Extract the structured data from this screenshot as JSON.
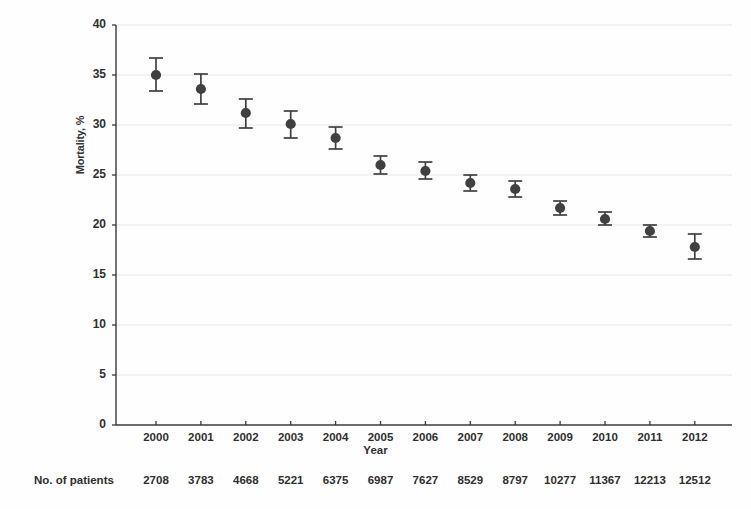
{
  "chart_data": {
    "type": "scatter",
    "title": "",
    "xlabel": "Year",
    "ylabel": "Mortality, %",
    "x": [
      2000,
      2001,
      2002,
      2003,
      2004,
      2005,
      2006,
      2007,
      2008,
      2009,
      2010,
      2011,
      2012
    ],
    "categories": [
      "2000",
      "2001",
      "2002",
      "2003",
      "2004",
      "2005",
      "2006",
      "2007",
      "2008",
      "2009",
      "2010",
      "2011",
      "2012"
    ],
    "values": [
      35.0,
      33.6,
      31.2,
      30.1,
      28.7,
      26.0,
      25.4,
      24.2,
      23.6,
      21.7,
      20.6,
      19.4,
      17.8
    ],
    "error_low": [
      33.4,
      32.1,
      29.7,
      28.7,
      27.6,
      25.1,
      24.6,
      23.4,
      22.8,
      21.0,
      20.0,
      18.8,
      16.6
    ],
    "error_high": [
      36.7,
      35.1,
      32.6,
      31.4,
      29.8,
      26.9,
      26.3,
      25.0,
      24.4,
      22.4,
      21.3,
      20.0,
      19.1
    ],
    "error_type": "95% CI",
    "xlim": [
      1999.5,
      2012.5
    ],
    "ylim": [
      0,
      40
    ],
    "yticks": [
      0,
      5,
      10,
      15,
      20,
      25,
      30,
      35,
      40
    ],
    "ytick_labels": [
      "0",
      "5",
      "10",
      "15",
      "20",
      "25",
      "30",
      "35",
      "40"
    ],
    "xticks": [
      2000,
      2001,
      2002,
      2003,
      2004,
      2005,
      2006,
      2007,
      2008,
      2009,
      2010,
      2011,
      2012
    ],
    "grid": true,
    "grid_axis": "y",
    "legend": null,
    "marker_color": "#404040",
    "grid_color": "#e8e8e8",
    "axis_color": "#3a3a3a"
  },
  "table": {
    "row_label": "No. of patients",
    "values": [
      "2708",
      "3783",
      "4668",
      "5221",
      "6375",
      "6987",
      "7627",
      "8529",
      "8797",
      "10277",
      "11367",
      "12213",
      "12512"
    ]
  }
}
